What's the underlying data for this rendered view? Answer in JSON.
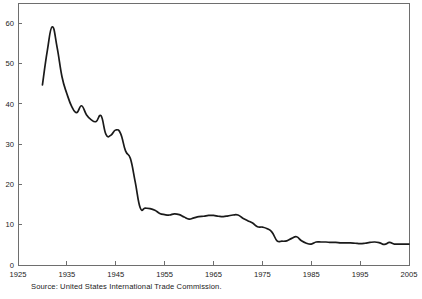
{
  "source_note": "Source: United States International Trade Commission.",
  "chart_data": {
    "type": "line",
    "title": "",
    "subtitle": "",
    "xlabel": "",
    "ylabel": "",
    "grid": false,
    "legend": false,
    "legend_position": "none",
    "line_color": "#1a1a1a",
    "axis_color": "#6e6e6e",
    "background_color": "#ffffff",
    "xlim": [
      1925,
      2005
    ],
    "ylim": [
      0,
      65
    ],
    "xticks": [
      1925,
      1935,
      1945,
      1955,
      1965,
      1975,
      1985,
      1995,
      2005
    ],
    "xtick_labels": [
      "1925",
      "1935",
      "1945",
      "1955",
      "1965",
      "1975",
      "1985",
      "1995",
      "2005"
    ],
    "yticks": [
      0,
      10,
      20,
      30,
      40,
      50,
      60
    ],
    "ytick_labels": [
      "0",
      "10",
      "20",
      "30",
      "40",
      "50",
      "60"
    ],
    "series": [
      {
        "name": "Average tariff rate",
        "x": [
          1930,
          1931,
          1932,
          1933,
          1934,
          1935,
          1936,
          1937,
          1938,
          1939,
          1940,
          1941,
          1942,
          1943,
          1944,
          1945,
          1946,
          1947,
          1948,
          1949,
          1950,
          1951,
          1952,
          1953,
          1954,
          1955,
          1956,
          1957,
          1958,
          1959,
          1960,
          1961,
          1962,
          1963,
          1964,
          1965,
          1966,
          1967,
          1968,
          1969,
          1970,
          1971,
          1972,
          1973,
          1974,
          1975,
          1976,
          1977,
          1978,
          1979,
          1980,
          1981,
          1982,
          1983,
          1984,
          1985,
          1986,
          1987,
          1988,
          1989,
          1990,
          1991,
          1992,
          1993,
          1994,
          1995,
          1996,
          1997,
          1998,
          1999,
          2000,
          2001,
          2002,
          2003,
          2004,
          2005
        ],
        "values": [
          44.7,
          53.2,
          59.1,
          54.0,
          46.7,
          42.5,
          39.3,
          37.8,
          39.5,
          37.3,
          36.0,
          35.6,
          37.0,
          32.4,
          32.2,
          33.5,
          32.6,
          28.3,
          26.4,
          20.5,
          14.2,
          14.1,
          14.0,
          13.6,
          12.8,
          12.5,
          12.4,
          12.7,
          12.5,
          11.9,
          11.4,
          11.7,
          12.0,
          12.1,
          12.3,
          12.3,
          12.1,
          12.0,
          12.2,
          12.4,
          12.4,
          11.6,
          11.0,
          10.4,
          9.5,
          9.4,
          9.0,
          8.1,
          6.0,
          5.9,
          6.0,
          6.6,
          7.0,
          6.0,
          5.4,
          5.2,
          5.7,
          5.7,
          5.7,
          5.6,
          5.6,
          5.5,
          5.5,
          5.5,
          5.4,
          5.3,
          5.4,
          5.6,
          5.7,
          5.5,
          5.1,
          5.6,
          5.2,
          5.2,
          5.2,
          5.2
        ]
      }
    ]
  }
}
